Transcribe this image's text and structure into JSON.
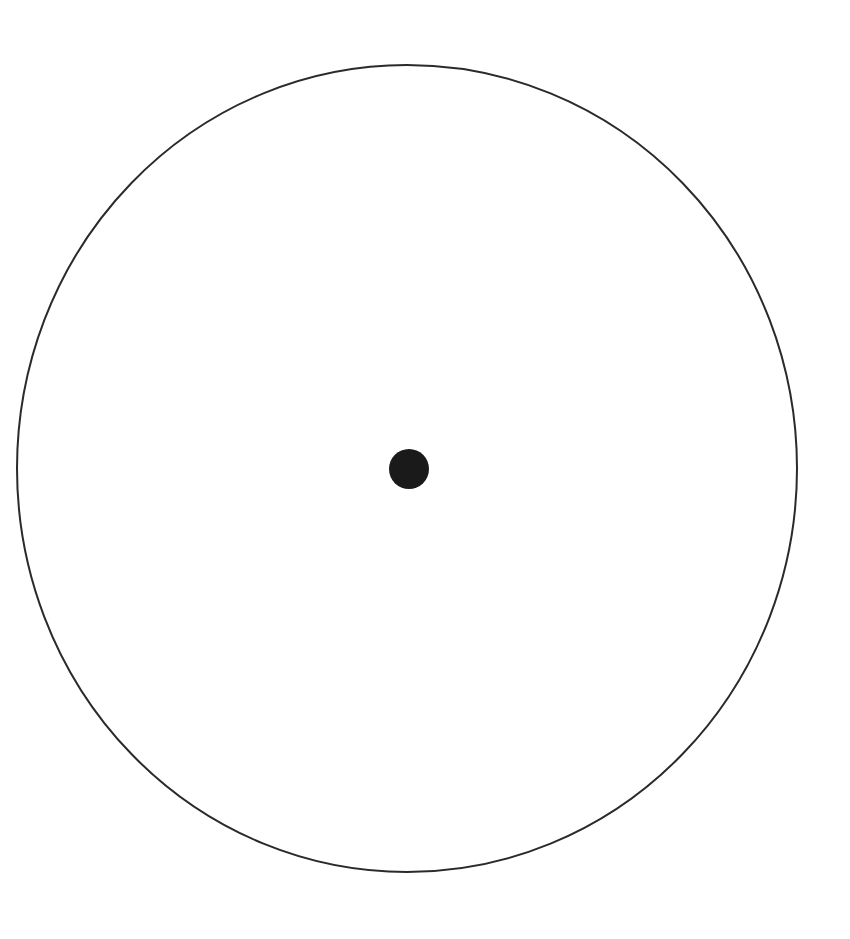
{
  "diagram": {
    "background": "#ffffff",
    "outer_circle": {
      "cx": 407,
      "cy": 468.5,
      "rx": 390,
      "ry": 403.5,
      "stroke": "#2a2a2a",
      "stroke_width": 2,
      "fill": "none"
    },
    "center_dot": {
      "cx": 409,
      "cy": 469,
      "r": 20,
      "fill": "#1a1a1a"
    }
  }
}
